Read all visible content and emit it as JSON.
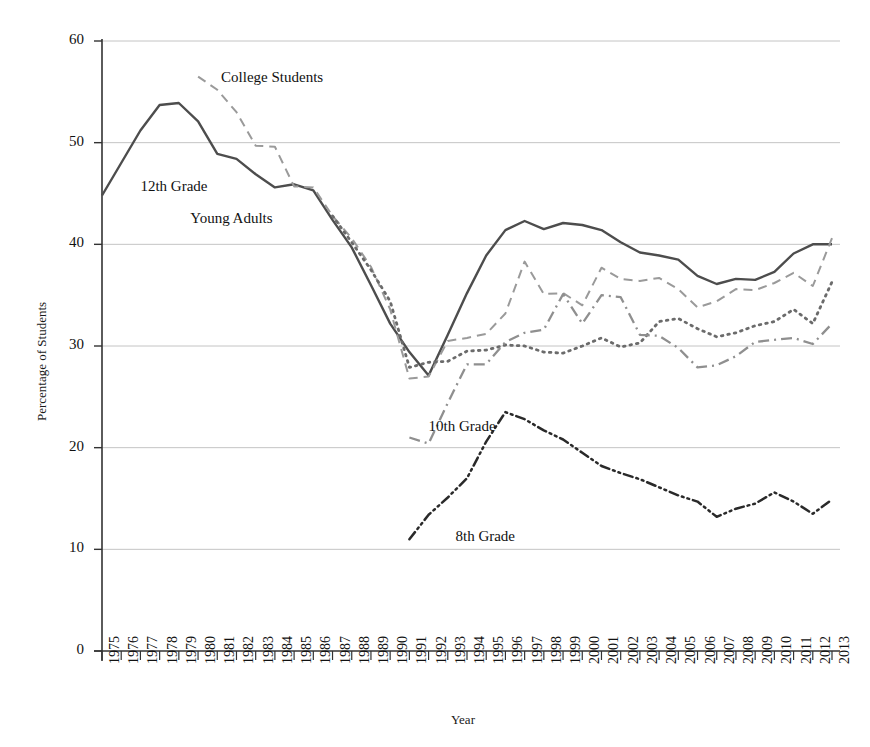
{
  "chart_data": {
    "type": "line",
    "title": "",
    "xlabel": "Year",
    "ylabel": "Percentage of Students",
    "xlim": [
      1975,
      2013
    ],
    "ylim": [
      0,
      60
    ],
    "yticks": [
      0,
      10,
      20,
      30,
      40,
      50,
      60
    ],
    "grid": "horizontal",
    "legend_position": "inline-annotations",
    "x": [
      1975,
      1976,
      1977,
      1978,
      1979,
      1980,
      1981,
      1982,
      1983,
      1984,
      1985,
      1986,
      1987,
      1988,
      1989,
      1990,
      1991,
      1992,
      1993,
      1994,
      1995,
      1996,
      1997,
      1998,
      1999,
      2000,
      2001,
      2002,
      2003,
      2004,
      2005,
      2006,
      2007,
      2008,
      2009,
      2010,
      2011,
      2012,
      2013
    ],
    "categories": [
      "1975",
      "1976",
      "1977",
      "1978",
      "1979",
      "1980",
      "1981",
      "1982",
      "1983",
      "1984",
      "1985",
      "1986",
      "1987",
      "1988",
      "1989",
      "1990",
      "1991",
      "1992",
      "1993",
      "1994",
      "1995",
      "1996",
      "1997",
      "1998",
      "1999",
      "2000",
      "2001",
      "2002",
      "2003",
      "2004",
      "2005",
      "2006",
      "2007",
      "2008",
      "2009",
      "2010",
      "2011",
      "2012",
      "2013"
    ],
    "series": [
      {
        "name": "12th Grade",
        "style": "solid",
        "color": "#4d4d4d",
        "label_x": 1977.0,
        "label_y": 45.6,
        "values": [
          44.8,
          48.0,
          51.2,
          53.7,
          53.9,
          52.1,
          48.9,
          48.4,
          46.9,
          45.6,
          45.9,
          45.3,
          42.4,
          39.7,
          36.0,
          32.2,
          29.4,
          27.1,
          31.1,
          35.2,
          38.9,
          41.4,
          42.3,
          41.5,
          42.1,
          41.9,
          41.4,
          40.2,
          39.2,
          38.9,
          38.5,
          36.9,
          36.1,
          36.6,
          36.5,
          37.3,
          39.1,
          40.0,
          40.0
        ]
      },
      {
        "name": "College Students",
        "style": "dashed",
        "color": "#9a9a9a",
        "label_x": 1981.2,
        "label_y": 56.4,
        "values": [
          null,
          null,
          null,
          null,
          null,
          56.5,
          55.2,
          53.0,
          49.7,
          49.6,
          45.7,
          45.6,
          42.8,
          40.6,
          37.8,
          33.6,
          26.8,
          27.0,
          30.5,
          30.8,
          31.2,
          33.2,
          38.3,
          35.1,
          35.2,
          34.0,
          37.7,
          36.6,
          36.4,
          36.7,
          35.6,
          33.8,
          34.4,
          35.6,
          35.5,
          36.2,
          37.2,
          35.9,
          40.6
        ]
      },
      {
        "name": "Young Adults",
        "style": "dotted",
        "color": "#6b6b6b",
        "label_x": 1979.6,
        "label_y": 42.5,
        "values": [
          null,
          null,
          null,
          null,
          null,
          null,
          null,
          null,
          null,
          null,
          null,
          null,
          42.8,
          40.2,
          37.5,
          34.4,
          27.9,
          28.4,
          28.5,
          29.5,
          29.6,
          30.1,
          30.0,
          29.4,
          29.3,
          30.0,
          30.8,
          29.9,
          30.3,
          32.4,
          32.7,
          31.7,
          30.9,
          31.3,
          32.0,
          32.4,
          33.6,
          32.2,
          36.3
        ]
      },
      {
        "name": "10th Grade",
        "style": "dashdot",
        "color": "#8f8f8f",
        "label_x": 1992.0,
        "label_y": 22.0,
        "values": [
          null,
          null,
          null,
          null,
          null,
          null,
          null,
          null,
          null,
          null,
          null,
          null,
          null,
          null,
          null,
          null,
          21.0,
          20.4,
          24.4,
          28.2,
          28.2,
          30.4,
          31.3,
          31.6,
          35.1,
          32.2,
          35.0,
          34.8,
          31.1,
          31.0,
          29.8,
          27.9,
          28.1,
          29.0,
          30.4,
          30.6,
          30.8,
          30.2,
          32.2
        ]
      },
      {
        "name": "8th Grade",
        "style": "dashdotdot",
        "color": "#2a2a2a",
        "label_x": 1993.4,
        "label_y": 11.2,
        "values": [
          null,
          null,
          null,
          null,
          null,
          null,
          null,
          null,
          null,
          null,
          null,
          null,
          null,
          null,
          null,
          null,
          11.0,
          13.4,
          15.1,
          17.0,
          20.6,
          23.5,
          22.8,
          21.7,
          20.8,
          19.5,
          18.2,
          17.5,
          16.9,
          16.1,
          15.3,
          14.7,
          13.2,
          14.0,
          14.5,
          15.6,
          14.7,
          13.5,
          14.9
        ]
      }
    ]
  },
  "axes": {
    "ylabel": "Percentage of Students",
    "xlabel": "Year"
  }
}
